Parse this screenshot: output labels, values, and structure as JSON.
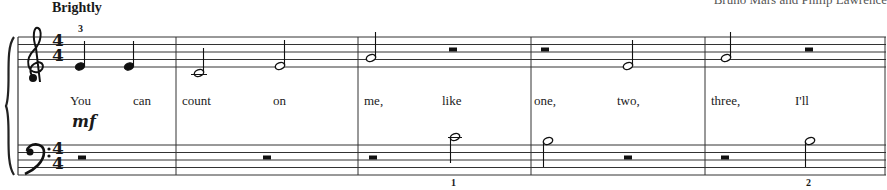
{
  "header": {
    "tempo_marking": "Brightly",
    "credit": "Bruno Mars and Philip Lawrence"
  },
  "score": {
    "time_signature": {
      "top": "4",
      "bottom": "4"
    },
    "treble_clef": "treble-clef",
    "bass_clef": "bass-clef",
    "dynamic": "mf",
    "fingerings": {
      "treble_m1": "3",
      "bass_m3": "1",
      "bass_m5": "2"
    },
    "lyrics": [
      {
        "text": "You",
        "x": 70
      },
      {
        "text": "can",
        "x": 133
      },
      {
        "text": "count",
        "x": 182
      },
      {
        "text": "on",
        "x": 273
      },
      {
        "text": "me,",
        "x": 364
      },
      {
        "text": "like",
        "x": 442
      },
      {
        "text": "one,",
        "x": 534
      },
      {
        "text": "two,",
        "x": 617
      },
      {
        "text": "three,",
        "x": 711
      },
      {
        "text": "I'll",
        "x": 795
      }
    ],
    "measures": [
      {
        "number": 1,
        "treble": [
          "E4 quarter",
          "E4 quarter"
        ],
        "bass": [
          "half rest"
        ]
      },
      {
        "number": 2,
        "treble": [
          "C4 half",
          "E4 half"
        ],
        "bass": [
          "half rest"
        ]
      },
      {
        "number": 3,
        "treble": [
          "G4 half",
          "half rest"
        ],
        "bass": [
          "half rest",
          "C4 half"
        ]
      },
      {
        "number": 4,
        "treble": [
          "half rest",
          "E4 half"
        ],
        "bass": [
          "B3 half",
          "half rest"
        ]
      },
      {
        "number": 5,
        "treble": [
          "G4 half",
          "half rest"
        ],
        "bass": [
          "half rest",
          "B3 half"
        ]
      }
    ]
  }
}
